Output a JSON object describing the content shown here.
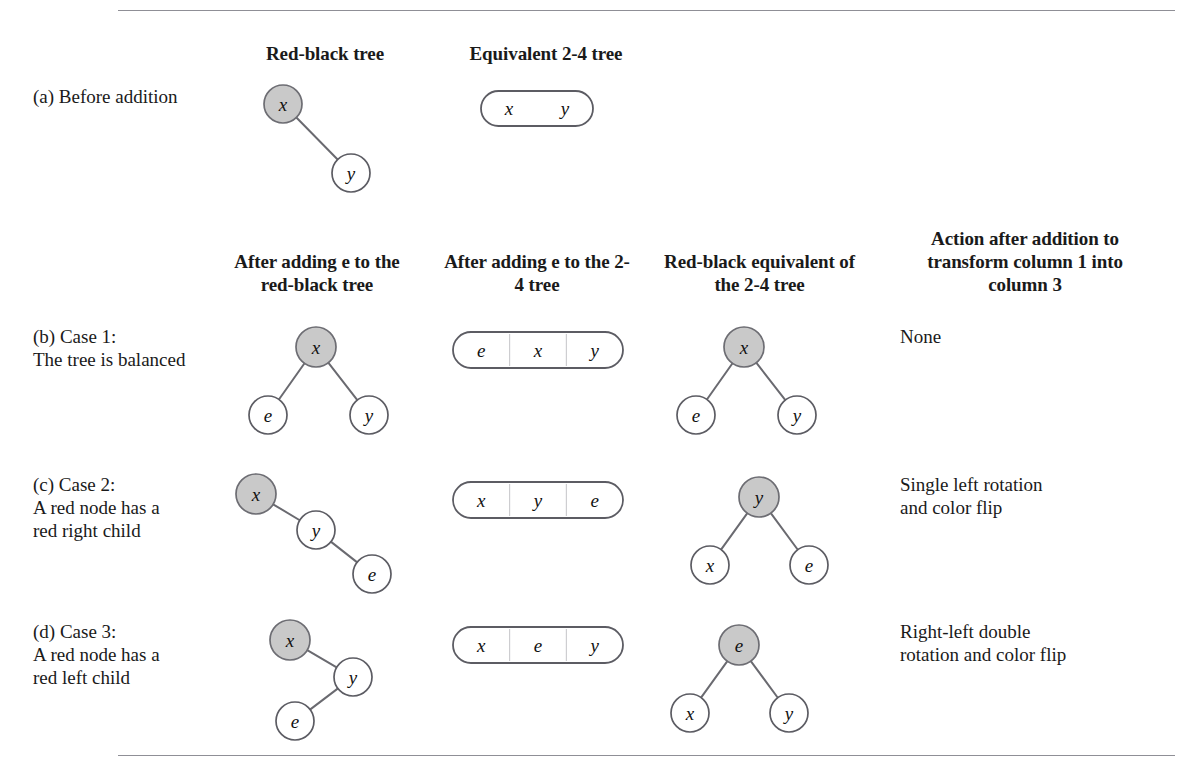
{
  "figure": {
    "caption_note": "",
    "rules": [
      "top-rule",
      "bottom-rule"
    ]
  },
  "headers": {
    "section_a": [
      {
        "id": "redblack-tree",
        "label": "Red-black tree",
        "x": 240,
        "y": 42,
        "w": 170
      },
      {
        "id": "equivalent-24-tree",
        "label": "Equivalent 2-4 tree",
        "x": 447,
        "y": 42,
        "w": 198
      }
    ],
    "section_b": [
      {
        "id": "after-adding-e-rb",
        "label": "After adding e to\nthe red-black tree",
        "x": 222,
        "y": 250,
        "w": 190
      },
      {
        "id": "after-adding-e-24",
        "label": "After adding e to\nthe 2-4 tree",
        "x": 442,
        "y": 250,
        "w": 190
      },
      {
        "id": "rb-equivalent-24",
        "label": "Red-black equivalent\nof the 2-4 tree",
        "x": 652,
        "y": 250,
        "w": 215
      },
      {
        "id": "action-after-addition",
        "label": "Action after addition\nto transform\ncolumn 1 into column 3",
        "x": 900,
        "y": 227,
        "w": 250
      }
    ]
  },
  "rows": [
    {
      "id": "row-a",
      "label": "(a) Before addition",
      "label_x": 33,
      "label_y": 85,
      "action": "",
      "col1_tree": {
        "nodes": [
          {
            "id": "a-c1-x",
            "label": "x",
            "cx": 283,
            "cy": 104,
            "r": 19,
            "color": "red"
          },
          {
            "id": "a-c1-y",
            "label": "y",
            "cx": 351,
            "cy": 173,
            "r": 19,
            "color": "black"
          }
        ],
        "edges": [
          {
            "from": "a-c1-x",
            "to": "a-c1-y"
          }
        ]
      },
      "col2_box": {
        "id": "a-box",
        "x": 481,
        "y": 91,
        "w": 112,
        "h": 35,
        "cells": [
          "x",
          "y"
        ],
        "dividers": false
      },
      "col3_tree": null
    },
    {
      "id": "row-b",
      "label": "(b) Case 1:\nThe tree is balanced",
      "label_x": 33,
      "label_y": 325,
      "action": "None",
      "action_x": 900,
      "action_y": 325,
      "col1_tree": {
        "nodes": [
          {
            "id": "b-c1-x",
            "label": "x",
            "cx": 316,
            "cy": 347,
            "r": 20,
            "color": "red"
          },
          {
            "id": "b-c1-e",
            "label": "e",
            "cx": 268,
            "cy": 415,
            "r": 19,
            "color": "black"
          },
          {
            "id": "b-c1-y",
            "label": "y",
            "cx": 369,
            "cy": 415,
            "r": 19,
            "color": "black"
          }
        ],
        "edges": [
          {
            "from": "b-c1-x",
            "to": "b-c1-e"
          },
          {
            "from": "b-c1-x",
            "to": "b-c1-y"
          }
        ]
      },
      "col2_box": {
        "id": "b-box",
        "x": 453,
        "y": 332,
        "w": 170,
        "h": 36,
        "cells": [
          "e",
          "x",
          "y"
        ],
        "dividers": true
      },
      "col3_tree": {
        "nodes": [
          {
            "id": "b-c3-x",
            "label": "x",
            "cx": 744,
            "cy": 347,
            "r": 20,
            "color": "red"
          },
          {
            "id": "b-c3-e",
            "label": "e",
            "cx": 696,
            "cy": 415,
            "r": 19,
            "color": "black"
          },
          {
            "id": "b-c3-y",
            "label": "y",
            "cx": 797,
            "cy": 415,
            "r": 19,
            "color": "black"
          }
        ],
        "edges": [
          {
            "from": "b-c3-x",
            "to": "b-c3-e"
          },
          {
            "from": "b-c3-x",
            "to": "b-c3-y"
          }
        ]
      }
    },
    {
      "id": "row-c",
      "label": "(c) Case 2:\nA red node has a\nred right child",
      "label_x": 33,
      "label_y": 473,
      "action": "Single left rotation\nand color flip",
      "action_x": 900,
      "action_y": 473,
      "col1_tree": {
        "nodes": [
          {
            "id": "c-c1-x",
            "label": "x",
            "cx": 256,
            "cy": 494,
            "r": 20,
            "color": "red"
          },
          {
            "id": "c-c1-y",
            "label": "y",
            "cx": 316,
            "cy": 530,
            "r": 19,
            "color": "black"
          },
          {
            "id": "c-c1-e",
            "label": "e",
            "cx": 372,
            "cy": 574,
            "r": 19,
            "color": "black"
          }
        ],
        "edges": [
          {
            "from": "c-c1-x",
            "to": "c-c1-y"
          },
          {
            "from": "c-c1-y",
            "to": "c-c1-e"
          }
        ]
      },
      "col2_box": {
        "id": "c-box",
        "x": 453,
        "y": 482,
        "w": 170,
        "h": 36,
        "cells": [
          "x",
          "y",
          "e"
        ],
        "dividers": true
      },
      "col3_tree": {
        "nodes": [
          {
            "id": "c-c3-y",
            "label": "y",
            "cx": 759,
            "cy": 497,
            "r": 20,
            "color": "red"
          },
          {
            "id": "c-c3-x",
            "label": "x",
            "cx": 710,
            "cy": 565,
            "r": 19,
            "color": "black"
          },
          {
            "id": "c-c3-e",
            "label": "e",
            "cx": 809,
            "cy": 565,
            "r": 19,
            "color": "black"
          }
        ],
        "edges": [
          {
            "from": "c-c3-y",
            "to": "c-c3-x"
          },
          {
            "from": "c-c3-y",
            "to": "c-c3-e"
          }
        ]
      }
    },
    {
      "id": "row-d",
      "label": "(d) Case 3:\nA red node has a\nred left child",
      "label_x": 33,
      "label_y": 620,
      "action": "Right-left double\nrotation and color flip",
      "action_x": 900,
      "action_y": 620,
      "col1_tree": {
        "nodes": [
          {
            "id": "d-c1-x",
            "label": "x",
            "cx": 290,
            "cy": 640,
            "r": 20,
            "color": "red"
          },
          {
            "id": "d-c1-y",
            "label": "y",
            "cx": 353,
            "cy": 677,
            "r": 19,
            "color": "black"
          },
          {
            "id": "d-c1-e",
            "label": "e",
            "cx": 295,
            "cy": 721,
            "r": 19,
            "color": "black"
          }
        ],
        "edges": [
          {
            "from": "d-c1-x",
            "to": "d-c1-y"
          },
          {
            "from": "d-c1-y",
            "to": "d-c1-e"
          }
        ]
      },
      "col2_box": {
        "id": "d-box",
        "x": 453,
        "y": 627,
        "w": 170,
        "h": 36,
        "cells": [
          "x",
          "e",
          "y"
        ],
        "dividers": true
      },
      "col3_tree": {
        "nodes": [
          {
            "id": "d-c3-e",
            "label": "e",
            "cx": 739,
            "cy": 645,
            "r": 20,
            "color": "red"
          },
          {
            "id": "d-c3-x",
            "label": "x",
            "cx": 690,
            "cy": 713,
            "r": 19,
            "color": "black"
          },
          {
            "id": "d-c3-y",
            "label": "y",
            "cx": 789,
            "cy": 713,
            "r": 19,
            "color": "black"
          }
        ],
        "edges": [
          {
            "from": "d-c3-e",
            "to": "d-c3-x"
          },
          {
            "from": "d-c3-e",
            "to": "d-c3-y"
          }
        ]
      }
    }
  ],
  "colors": {
    "red_node_fill": "#c9c9c9",
    "black_node_fill": "#ffffff",
    "stroke": "#5c5c63",
    "rule": "#8f8f96",
    "text": "#1a1a1a"
  }
}
